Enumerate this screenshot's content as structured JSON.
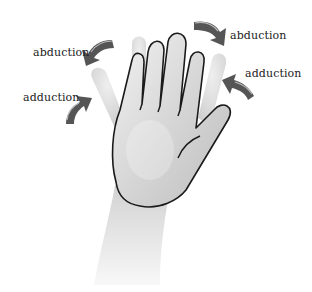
{
  "diagram": {
    "labels": {
      "left_top": "abduction",
      "left_bottom": "adduction",
      "right_top": "abduction",
      "right_bottom": "adduction"
    },
    "colors": {
      "arrow": "#555555",
      "arrow_highlight": "#bbbbbb",
      "outline": "#1a1a1a",
      "skin_light": "#e8e8e8",
      "skin_shade": "#c4c4c4",
      "ghost_finger": "#dcdcdc"
    }
  }
}
